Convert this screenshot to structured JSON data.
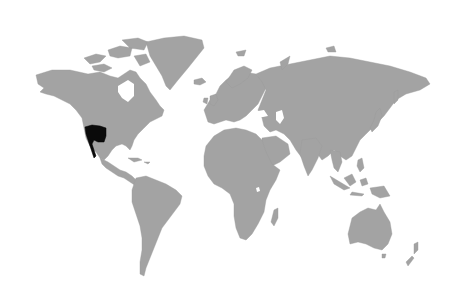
{
  "map": {
    "type": "world-map",
    "projection": "equirectangular-like",
    "colors": {
      "background": "#ffffff",
      "land": "#a3a3a3",
      "highlight": "#0a0a0a"
    },
    "highlighted_region": {
      "name": "Southwestern United States and Baja California",
      "approx_bbox_px": [
        84,
        125,
        106,
        160
      ]
    },
    "continents": [
      "north-america",
      "greenland",
      "south-america",
      "europe",
      "africa",
      "asia",
      "australia",
      "new-zealand"
    ]
  }
}
